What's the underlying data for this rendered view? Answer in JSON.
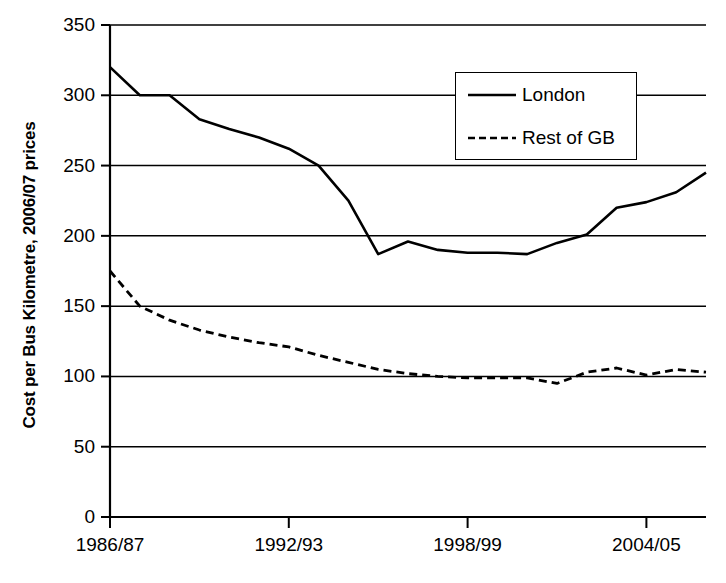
{
  "chart_data": {
    "type": "line",
    "title": "",
    "xlabel": "",
    "ylabel": "Cost per Bus Kilometre, 2006/07 prices",
    "ylim": [
      0,
      350
    ],
    "ytick_labels": [
      "350",
      "300",
      "250",
      "200",
      "150",
      "100",
      "50",
      "0"
    ],
    "ytick_values": [
      350,
      300,
      250,
      200,
      150,
      100,
      50,
      0
    ],
    "grid": true,
    "grid_axis": "y",
    "legend_position": "top-right-inside",
    "x": [
      "1986/87",
      "1987/88",
      "1988/89",
      "1989/90",
      "1990/91",
      "1991/92",
      "1992/93",
      "1993/94",
      "1994/95",
      "1995/96",
      "1996/97",
      "1997/98",
      "1998/99",
      "1999/00",
      "2000/01",
      "2001/02",
      "2002/03",
      "2003/04",
      "2004/05",
      "2005/06",
      "2006/07"
    ],
    "xtick_labels": [
      "1986/87",
      "1992/93",
      "1998/99",
      "2004/05"
    ],
    "xtick_indices": [
      0,
      6,
      12,
      18
    ],
    "series": [
      {
        "name": "London",
        "style": "solid",
        "color": "#000000",
        "values": [
          320,
          300,
          300,
          283,
          276,
          270,
          262,
          250,
          225,
          187,
          196,
          190,
          188,
          188,
          187,
          195,
          201,
          220,
          224,
          231,
          245
        ]
      },
      {
        "name": "Rest of GB",
        "style": "dashed",
        "color": "#000000",
        "values": [
          175,
          150,
          140,
          133,
          128,
          124,
          121,
          115,
          110,
          105,
          102,
          100,
          99,
          99,
          99,
          95,
          103,
          106,
          101,
          105,
          103
        ]
      }
    ]
  },
  "legend": {
    "items": [
      {
        "label": "London",
        "style": "solid"
      },
      {
        "label": "Rest of GB",
        "style": "dashed"
      }
    ]
  },
  "axis_label": {
    "y": "Cost per Bus Kilometre, 2006/07 prices"
  }
}
